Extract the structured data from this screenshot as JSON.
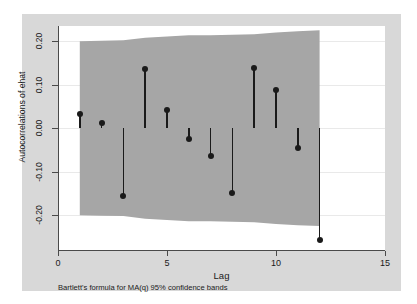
{
  "chart_data": {
    "type": "scatter",
    "title": "",
    "xlabel": "Lag",
    "ylabel": "Autocorrelations of ehat",
    "xlim": [
      0,
      15
    ],
    "ylim": [
      -0.28,
      0.235
    ],
    "xticks": [
      "0",
      "5",
      "10",
      "15"
    ],
    "xtick_values": [
      0,
      5,
      10,
      15
    ],
    "yticks": [
      "0.20",
      "0.10",
      "0.00",
      "-0.10",
      "-0.20"
    ],
    "ytick_values": [
      0.2,
      0.1,
      0.0,
      -0.1,
      -0.2
    ],
    "grid": true,
    "legend": false,
    "note": "Bartlett's formula for MA(q) 95% confidence bands",
    "x": [
      1,
      2,
      3,
      4,
      5,
      6,
      7,
      8,
      9,
      10,
      11,
      12
    ],
    "values": [
      0.033,
      0.013,
      -0.155,
      0.136,
      0.042,
      -0.025,
      -0.064,
      -0.148,
      0.139,
      0.087,
      -0.045,
      -0.257
    ],
    "band_upper": [
      0.2,
      0.201,
      0.202,
      0.208,
      0.211,
      0.214,
      0.214,
      0.215,
      0.216,
      0.22,
      0.223,
      0.225
    ],
    "band_lower": [
      -0.2,
      -0.201,
      -0.202,
      -0.208,
      -0.211,
      -0.214,
      -0.214,
      -0.215,
      -0.216,
      -0.22,
      -0.223,
      -0.225
    ],
    "band_label": "95% confidence band",
    "colors": {
      "band": "#a6a6a6",
      "marker": "#1a1a1a",
      "stem": "#1a1a1a",
      "grid": "#e9e9e9",
      "axis": "#4a4a4a",
      "figure_background": "#d8d8d8",
      "plot_background": "#ffffff"
    }
  }
}
